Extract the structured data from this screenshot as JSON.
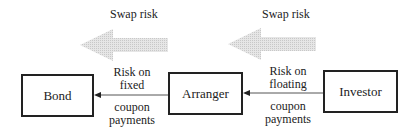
{
  "diagram": {
    "nodes": [
      {
        "id": "bond",
        "label": "Bond"
      },
      {
        "id": "arranger",
        "label": "Arranger"
      },
      {
        "id": "investor",
        "label": "Investor"
      }
    ],
    "swap_risk_labels": [
      "Swap risk",
      "Swap risk"
    ],
    "edges": [
      {
        "from": "arranger",
        "to": "bond",
        "label_above": [
          "Risk on",
          "fixed"
        ],
        "label_below": [
          "coupon",
          "payments"
        ]
      },
      {
        "from": "investor",
        "to": "arranger",
        "label_above": [
          "Risk on",
          "floating"
        ],
        "label_below": [
          "coupon",
          "payments"
        ]
      }
    ],
    "colors": {
      "risk_arrow": "#d9d9d9",
      "line": "#222222"
    }
  }
}
